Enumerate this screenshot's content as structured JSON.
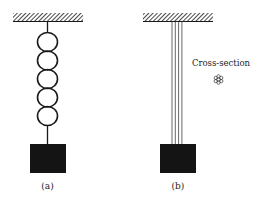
{
  "figure": {
    "type": "physics-diagram",
    "panels": [
      {
        "id": "a",
        "label": "(a)",
        "support": "hatched-ceiling",
        "suspension": "chain",
        "chain_links": 5,
        "load": "black-block"
      },
      {
        "id": "b",
        "label": "(b)",
        "support": "hatched-ceiling",
        "suspension": "wire-bundle",
        "wire_count": 4,
        "load": "black-block",
        "annotation": {
          "text": "Cross-section",
          "icon": "strand-bundle-cross-section-icon",
          "strands_in_cross_section": 7
        }
      }
    ],
    "colors": {
      "ink": "#1a1a1a",
      "wire": "#555555",
      "background": "#ffffff"
    }
  }
}
